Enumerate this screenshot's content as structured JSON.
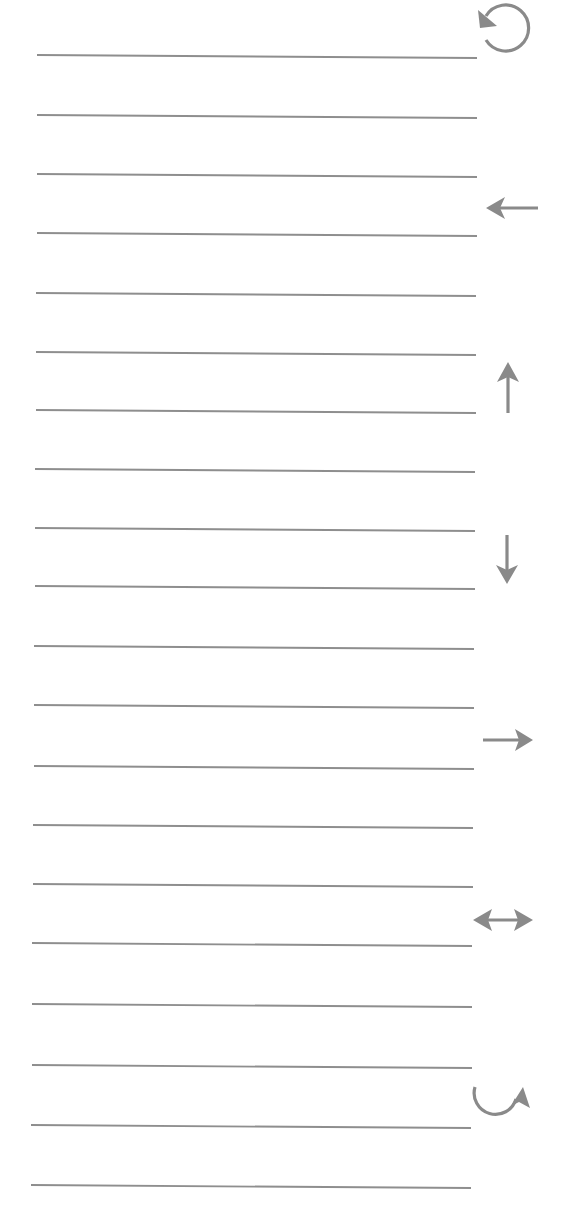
{
  "worksheet": {
    "line_color": "#8e8e8e",
    "icon_color": "#8a8a8a",
    "writing_lines": [
      {
        "x1": 37,
        "y1": 55,
        "x2": 477,
        "y2": 58
      },
      {
        "x1": 37,
        "y1": 115,
        "x2": 477,
        "y2": 118
      },
      {
        "x1": 37,
        "y1": 174,
        "x2": 477,
        "y2": 177
      },
      {
        "x1": 37,
        "y1": 233,
        "x2": 477,
        "y2": 236
      },
      {
        "x1": 36,
        "y1": 293,
        "x2": 476,
        "y2": 296
      },
      {
        "x1": 36,
        "y1": 352,
        "x2": 476,
        "y2": 355
      },
      {
        "x1": 36,
        "y1": 410,
        "x2": 476,
        "y2": 413
      },
      {
        "x1": 35,
        "y1": 469,
        "x2": 475,
        "y2": 472
      },
      {
        "x1": 35,
        "y1": 528,
        "x2": 475,
        "y2": 531
      },
      {
        "x1": 35,
        "y1": 586,
        "x2": 475,
        "y2": 589
      },
      {
        "x1": 34,
        "y1": 646,
        "x2": 474,
        "y2": 649
      },
      {
        "x1": 34,
        "y1": 705,
        "x2": 474,
        "y2": 708
      },
      {
        "x1": 34,
        "y1": 766,
        "x2": 474,
        "y2": 769
      },
      {
        "x1": 33,
        "y1": 825,
        "x2": 473,
        "y2": 828
      },
      {
        "x1": 33,
        "y1": 884,
        "x2": 473,
        "y2": 887
      },
      {
        "x1": 32,
        "y1": 943,
        "x2": 472,
        "y2": 946
      },
      {
        "x1": 32,
        "y1": 1004,
        "x2": 472,
        "y2": 1007
      },
      {
        "x1": 32,
        "y1": 1065,
        "x2": 472,
        "y2": 1068
      },
      {
        "x1": 31,
        "y1": 1125,
        "x2": 471,
        "y2": 1128
      },
      {
        "x1": 31,
        "y1": 1185,
        "x2": 471,
        "y2": 1188
      }
    ],
    "direction_icons": [
      {
        "name": "rotate-counterclockwise-icon",
        "cx": 507,
        "cy": 27
      },
      {
        "name": "arrow-left-icon",
        "cx": 512,
        "cy": 208
      },
      {
        "name": "arrow-up-icon",
        "cx": 508,
        "cy": 388
      },
      {
        "name": "arrow-down-icon",
        "cx": 508,
        "cy": 560
      },
      {
        "name": "arrow-right-icon",
        "cx": 509,
        "cy": 740
      },
      {
        "name": "arrow-left-right-icon",
        "cx": 503,
        "cy": 920
      },
      {
        "name": "curved-arrow-up-right-icon",
        "cx": 500,
        "cy": 1103
      }
    ]
  }
}
